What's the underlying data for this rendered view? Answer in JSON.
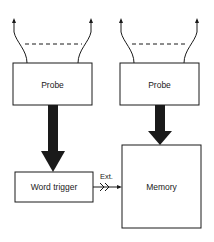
{
  "diagram": {
    "left_channel": {
      "probe_label": "Probe",
      "trigger_label": "Word trigger"
    },
    "right_channel": {
      "probe_label": "Probe",
      "memory_label": "Memory"
    },
    "connection": {
      "ext_label": "Ext."
    },
    "colors": {
      "stroke": "#1a1a1a",
      "background": "#ffffff"
    }
  }
}
